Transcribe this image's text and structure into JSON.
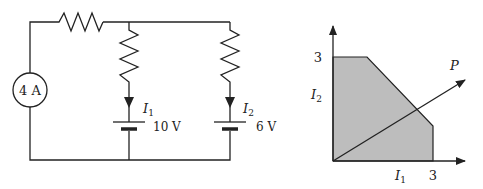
{
  "circuit": {
    "current_source_label": "4 A",
    "branch1": {
      "current_label": "I",
      "current_sub": "1",
      "battery_label": "10 V"
    },
    "branch2": {
      "current_label": "I",
      "current_sub": "2",
      "battery_label": "6 V"
    }
  },
  "graph": {
    "y_axis_label": "I",
    "y_axis_sub": "2",
    "x_axis_label": "I",
    "x_axis_sub": "1",
    "y_tick": "3",
    "x_tick": "3",
    "vector_label": "P"
  },
  "colors": {
    "line": "#222222",
    "fill": "#bdbdbd"
  }
}
